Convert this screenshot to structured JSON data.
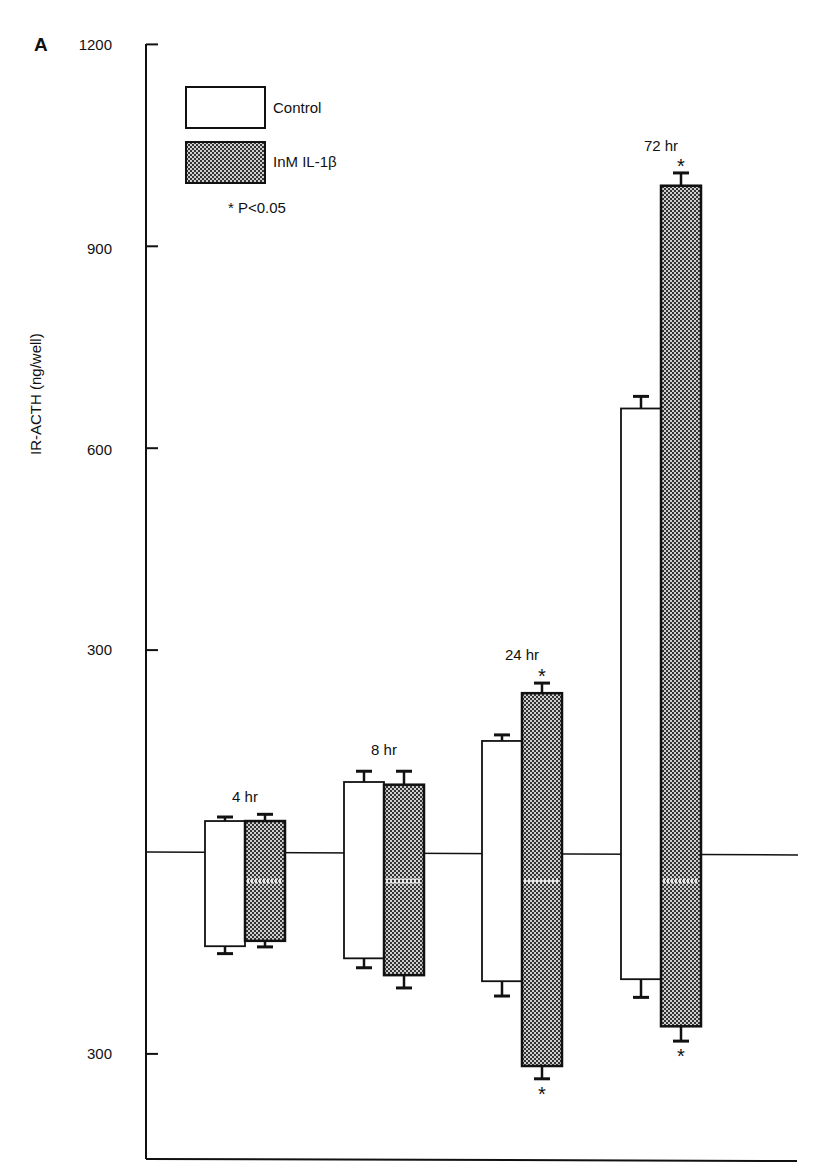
{
  "panel": "A",
  "chart_data": {
    "type": "bar",
    "title": "",
    "panel_label": "A",
    "ylabel": "IR-ACTH (ng/well)",
    "xlabel": "",
    "upper_axis": {
      "ticks": [
        300,
        600,
        900,
        1200
      ],
      "top": 1200
    },
    "lower_axis": {
      "ticks": [
        300
      ],
      "note": "mirrored scale below the zero line"
    },
    "categories": [
      "4 hr",
      "8 hr",
      "24 hr",
      "72 hr"
    ],
    "series": [
      {
        "name": "Control",
        "fill": "white",
        "upper_values": [
          46,
          104,
          165,
          659
        ],
        "upper_error": [
          6,
          16,
          9,
          18
        ],
        "lower_values": [
          140,
          158,
          192,
          189
        ],
        "lower_error": [
          11,
          14,
          22,
          27
        ]
      },
      {
        "name": "InM IL-1β",
        "fill": "crosshatch",
        "upper_values": [
          46,
          100,
          236,
          990
        ],
        "upper_error": [
          10,
          20,
          15,
          19
        ],
        "lower_values": [
          132,
          183,
          318,
          259
        ],
        "lower_error": [
          9,
          19,
          19,
          22
        ]
      }
    ],
    "significance": {
      "upper": {
        "4 hr": false,
        "8 hr": false,
        "24 hr": true,
        "72 hr": true
      },
      "lower": {
        "4 hr": false,
        "8 hr": false,
        "24 hr": true,
        "72 hr": true
      }
    },
    "legend": {
      "entries": [
        "Control",
        "InM IL-1β"
      ],
      "note": "* P<0.05",
      "position": "upper-left"
    },
    "grid": false
  },
  "labels": {
    "ytick_1200": "1200",
    "ytick_900": "900",
    "ytick_600": "600",
    "ytick_300_upper": "300",
    "ytick_300_lower": "300",
    "legend_control": "Control",
    "legend_il1b": "InM IL-1β",
    "legend_note": "* P<0.05",
    "g4": "4 hr",
    "g8": "8 hr",
    "g24": "24 hr",
    "g72": "72 hr",
    "star": "★"
  }
}
